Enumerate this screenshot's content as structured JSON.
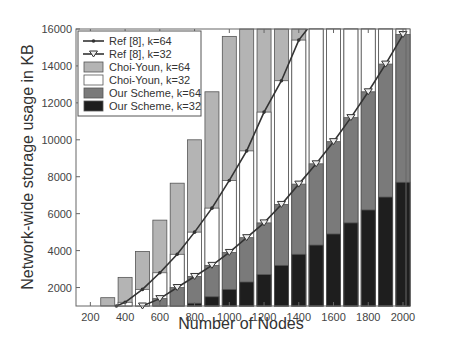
{
  "chart_data": {
    "type": "bar",
    "title": "",
    "xlabel": "Number of Nodes",
    "ylabel": "Network-wide storage usage in KB",
    "xlim": [
      100,
      2000
    ],
    "ylim": [
      1000,
      16000
    ],
    "x_ticks": [
      200,
      400,
      600,
      800,
      1000,
      1200,
      1400,
      1600,
      1800,
      2000
    ],
    "y_ticks": [
      2000,
      4000,
      6000,
      8000,
      10000,
      12000,
      14000,
      16000
    ],
    "grid": false,
    "legend_position": "upper left",
    "categories": [
      300,
      400,
      500,
      600,
      700,
      800,
      900,
      1000,
      1100,
      1200,
      1300,
      1400,
      1500,
      1600,
      1700,
      1800,
      1900,
      2000
    ],
    "series": [
      {
        "name": "Choi-Youn, k=64",
        "kind": "bar",
        "color": "#b4b4b4",
        "values": [
          1450,
          2550,
          3950,
          5650,
          7650,
          10000,
          12600,
          15600,
          16000,
          16000,
          16000,
          16000,
          16000,
          16000,
          16000,
          16000,
          16000,
          16000
        ]
      },
      {
        "name": "Choi-Youn, k=32",
        "kind": "bar",
        "color": "#ffffff",
        "values": [
          1000,
          1200,
          1900,
          2800,
          3800,
          5000,
          6300,
          7800,
          9400,
          11500,
          13200,
          15400,
          16000,
          16000,
          16000,
          16000,
          16000,
          16000
        ]
      },
      {
        "name": "Our Scheme, k=64",
        "kind": "bar",
        "color": "#7a7a7a",
        "values": [
          0,
          0,
          1000,
          1400,
          2000,
          2600,
          3200,
          3900,
          4700,
          5500,
          6500,
          7600,
          8700,
          9900,
          11200,
          12600,
          14100,
          15700
        ]
      },
      {
        "name": "Our Scheme, k=32",
        "kind": "bar",
        "color": "#1e1e1e",
        "values": [
          0,
          0,
          0,
          0,
          0,
          1150,
          1500,
          1900,
          2300,
          2700,
          3200,
          3800,
          4300,
          4900,
          5500,
          6200,
          6900,
          7700
        ]
      },
      {
        "name": "Ref [8], k=64",
        "kind": "line",
        "marker": "dot",
        "color": "#333333",
        "x": [
          350,
          400,
          500,
          600,
          700,
          800,
          900,
          1000,
          1100,
          1200,
          1300,
          1400,
          1450
        ],
        "values": [
          1000,
          1200,
          1900,
          2800,
          3800,
          5000,
          6300,
          7800,
          9400,
          11500,
          13200,
          15400,
          16000
        ]
      },
      {
        "name": "Ref [8], k=32",
        "kind": "line",
        "marker": "triangle-down",
        "color": "#333333",
        "x": [
          500,
          600,
          700,
          800,
          900,
          1000,
          1100,
          1200,
          1300,
          1400,
          1500,
          1600,
          1700,
          1800,
          1900,
          2000
        ],
        "values": [
          1000,
          1400,
          2000,
          2600,
          3200,
          3900,
          4700,
          5500,
          6500,
          7600,
          8700,
          9900,
          11200,
          12600,
          14100,
          15700
        ]
      }
    ],
    "legend": [
      "Ref [8], k=64",
      "Ref [8], k=32",
      "Choi-Youn, k=64",
      "Choi-Youn, k=32",
      "Our Scheme, k=64",
      "Our Scheme, k=32"
    ]
  }
}
